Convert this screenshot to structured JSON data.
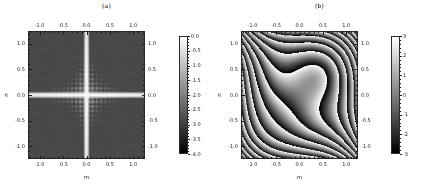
{
  "figure": {
    "width": 426,
    "height": 190,
    "background": "#ffffff",
    "colormap": "gray"
  },
  "panels": [
    {
      "id": "panel-a",
      "title": "(a)",
      "xlabel": "m",
      "ylabel": "n",
      "xticks": [
        "-1.0",
        "-0.5",
        "0.0",
        "0.5",
        "1.0"
      ],
      "yticks": [
        "1.0",
        "0.5",
        "0.0",
        "-0.5",
        "-1.0"
      ],
      "top_xticks": [
        "-1.0",
        "-0.5",
        "0.0",
        "0.5",
        "1.0"
      ],
      "right_yticks": [
        "1.0",
        "0.5",
        "0.0",
        "-0.5",
        "-1.0"
      ],
      "colorbar_ticks": [
        "0.0",
        "-0.5",
        "-1.0",
        "-1.5",
        "-2.0",
        "-2.5",
        "-3.0",
        "-3.5",
        "-4.0"
      ]
    },
    {
      "id": "panel-b",
      "title": "(b)",
      "xlabel": "m",
      "ylabel": "n",
      "xticks": [
        "-1.0",
        "-0.5",
        "0.0",
        "0.5",
        "1.0"
      ],
      "yticks": [
        "1.0",
        "0.5",
        "0.0",
        "-0.5",
        "-1.0"
      ],
      "top_xticks": [
        "-1.0",
        "-0.5",
        "0.0",
        "0.5",
        "1.0"
      ],
      "right_yticks": [
        "1.0",
        "0.5",
        "0.0",
        "-0.5",
        "-1.0"
      ],
      "colorbar_ticks": [
        "3",
        "2",
        "1",
        "0",
        "-1",
        "-2",
        "-3"
      ]
    }
  ],
  "chart_data": [
    {
      "type": "heatmap",
      "title": "(a)",
      "xlabel": "m",
      "ylabel": "n",
      "xlim": [
        -1.25,
        1.25
      ],
      "ylim": [
        -1.25,
        1.25
      ],
      "xticks": [
        -1.0,
        -0.5,
        0.0,
        0.5,
        1.0
      ],
      "yticks": [
        -1.0,
        -0.5,
        0.0,
        0.5,
        1.0
      ],
      "xticklabels": [
        "-1.0",
        "-0.5",
        "0.0",
        "0.5",
        "1.0"
      ],
      "yticklabels": [
        "-1.0",
        "-0.5",
        "0.0",
        "0.5",
        "1.0"
      ],
      "grid": false,
      "colorbar": {
        "position": "right",
        "vmin": -4.0,
        "vmax": 0.0,
        "ticks": [
          0.0,
          -0.5,
          -1.0,
          -1.5,
          -2.0,
          -2.5,
          -3.0,
          -3.5,
          -4.0
        ],
        "ticklabels": [
          "0.0",
          "-0.5",
          "-1.0",
          "-1.5",
          "-2.0",
          "-2.5",
          "-3.0",
          "-3.5",
          "-4.0"
        ],
        "cmap": "gray",
        "label": ""
      },
      "description": "Log-magnitude map: uniform mid-gray field (~ -2.2) with a bright white cross of near-zero value along the m=0 and n=0 axes; faint speckle texture elsewhere.",
      "features": {
        "background_value": -2.2,
        "cross_value": 0.0,
        "cross_axes": [
          "m = 0.0",
          "n = 0.0"
        ],
        "center_value": 0.0,
        "edge_value": -2.6
      }
    },
    {
      "type": "heatmap",
      "title": "(b)",
      "xlabel": "m",
      "ylabel": "n",
      "xlim": [
        -1.25,
        1.25
      ],
      "ylim": [
        -1.25,
        1.25
      ],
      "xticks": [
        -1.0,
        -0.5,
        0.0,
        0.5,
        1.0
      ],
      "yticks": [
        -1.0,
        -0.5,
        0.0,
        0.5,
        1.0
      ],
      "xticklabels": [
        "-1.0",
        "-0.5",
        "0.0",
        "0.5",
        "1.0"
      ],
      "yticklabels": [
        "-1.0",
        "-0.5",
        "0.0",
        "0.5",
        "1.0"
      ],
      "grid": false,
      "colorbar": {
        "position": "right",
        "vmin": -3,
        "vmax": 3,
        "ticks": [
          3,
          2,
          1,
          0,
          -1,
          -2,
          -3
        ],
        "ticklabels": [
          "3",
          "2",
          "1",
          "0",
          "-1",
          "-2",
          "-3"
        ],
        "cmap": "gray",
        "label": ""
      },
      "description": "Wrapped-phase map spanning -pi to pi. Dense vertical sawtooth fringes near the left and right edges, widening toward the centre into S-shaped lobes. A bright (+3) plateau occupies the lower-left inner lobe and a dark (-3) plateau the upper-right inner lobe, with the phase wrapping discontinuity at m = 0.",
      "features": {
        "bright_lobe_center": [
          -0.2,
          -0.25
        ],
        "dark_lobe_center": [
          0.2,
          0.25
        ],
        "wrap_discontinuity": "m = 0.0",
        "fringe_count_per_side": 18
      }
    }
  ]
}
